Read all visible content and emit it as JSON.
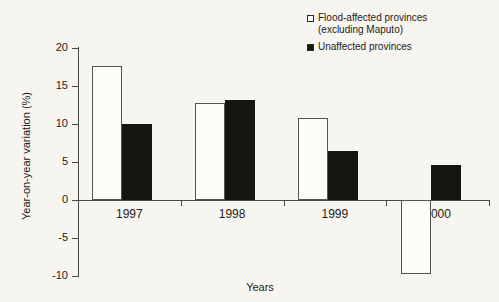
{
  "chart_data": {
    "type": "bar",
    "title": "",
    "subtitle": "",
    "xlabel": "Years",
    "ylabel": "Year-on-year variation (%)",
    "categories": [
      "1997",
      "1998",
      "1999",
      "2000"
    ],
    "series": [
      {
        "name": "Flood-affected provinces (excluding Maputo)",
        "style": "hollow",
        "color": "#ffffff",
        "edge_color": "#000000",
        "values": [
          17.6,
          12.8,
          10.8,
          -9.7
        ]
      },
      {
        "name": "Unaffected provinces",
        "style": "filled",
        "color": "#000000",
        "edge_color": "#000000",
        "values": [
          10.0,
          13.2,
          6.5,
          4.6
        ]
      }
    ],
    "ylim": [
      -10,
      20
    ],
    "yticks": [
      20,
      15,
      10,
      5,
      0,
      -5,
      -10
    ],
    "ytick_labels": [
      "20",
      "15",
      "10",
      "5",
      "0",
      "-5",
      "-10"
    ],
    "grid": false,
    "legend_position": "top-right",
    "zero_line": 0
  },
  "legend": {
    "items": [
      {
        "label": "Flood-affected provinces\n(excluding Maputo)",
        "swatch": "hollow"
      },
      {
        "label": "Unaffected provinces",
        "swatch": "filled"
      }
    ]
  },
  "axes": {
    "y_title": "Year-on-year variation (%)",
    "x_title": "Years",
    "y_ticks": [
      "20",
      "15",
      "10",
      "5",
      "0",
      "-5",
      "-10"
    ],
    "x_ticks": [
      "1997",
      "1998",
      "1999",
      "2000"
    ]
  },
  "colors": {
    "background": "#f7f5f0",
    "axis": "#4a4845",
    "text": "#1d1b17",
    "bar_filled": "#17150f",
    "bar_hollow": "#fdfcf8"
  }
}
